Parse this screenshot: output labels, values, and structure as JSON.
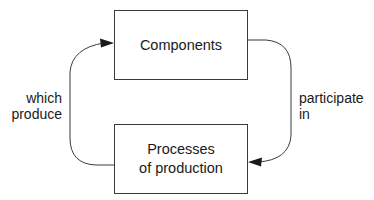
{
  "diagram": {
    "nodes": [
      {
        "id": "components",
        "lines": [
          "Components"
        ]
      },
      {
        "id": "processes",
        "lines": [
          "Processes",
          "of production"
        ]
      }
    ],
    "edges": [
      {
        "from": "components",
        "to": "processes",
        "label_lines": [
          "participate",
          "in"
        ]
      },
      {
        "from": "processes",
        "to": "components",
        "label_lines": [
          "which",
          "produce"
        ]
      }
    ],
    "colors": {
      "stroke": "#3a3a3a",
      "text": "#1a1a1a",
      "background": "#ffffff"
    }
  }
}
